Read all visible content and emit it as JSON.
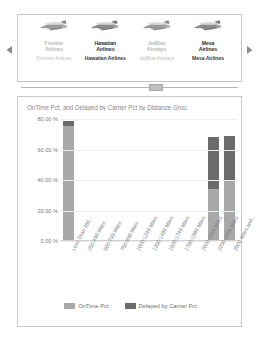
{
  "carousel": {
    "prev_icon": "triangle-left-icon",
    "next_icon": "triangle-right-icon",
    "items": [
      {
        "icon": "airplane-icon",
        "title": "Frontier Airlines",
        "subtitle": "Frontier Airlines",
        "state": "dim"
      },
      {
        "icon": "airplane-icon",
        "title": "Hawaiian Airlines",
        "subtitle": "Hawaiian Airlines",
        "state": "on"
      },
      {
        "icon": "airplane-icon",
        "title": "JetBlue Airways",
        "subtitle": "JetBlue Airways",
        "state": "dim"
      },
      {
        "icon": "airplane-icon",
        "title": "Mesa Airlines",
        "subtitle": "Mesa Airlines",
        "state": "on"
      }
    ]
  },
  "slider": {
    "name": "horizontal-scroll-slider",
    "thumb_position_pct": 62
  },
  "chart_data": {
    "type": "bar",
    "stacked": true,
    "title": "OnTime Pct, and Delayed by Carrier Pct by Distance Grou",
    "xlabel": "",
    "ylabel": "",
    "ylim": [
      0,
      80
    ],
    "grid": true,
    "legend_position": "bottom",
    "ytick_labels": [
      "0.00 %",
      "20.00 %",
      "40.00 %",
      "60.00 %",
      "80.00 %"
    ],
    "ytick_values": [
      0,
      20,
      40,
      60,
      80
    ],
    "categories": [
      "Less Than 250...",
      "250-499 Miles",
      "500-749 Miles",
      "750-999 Miles",
      "1000-1249 Miles",
      "1250-1499 Miles",
      "1500-1749 Miles",
      "1750-1999 Miles",
      "2000-2249 Miles",
      "2250-2499 Miles",
      "2500 Miles and..."
    ],
    "series": [
      {
        "name": "OnTime Pct",
        "color": "#a8a8a8",
        "values": [
          75.5,
          0,
          0,
          0,
          0,
          0,
          0,
          0,
          0,
          34.0,
          39.5
        ]
      },
      {
        "name": "Delayed by Carrier Pct",
        "color": "#6b6b6b",
        "values": [
          3.5,
          0,
          0,
          0,
          0,
          0,
          0,
          0,
          0,
          34.5,
          29.5
        ]
      }
    ],
    "totals": [
      79.0,
      0,
      0,
      0,
      0,
      0,
      0,
      0,
      0,
      68.5,
      69.0
    ]
  }
}
